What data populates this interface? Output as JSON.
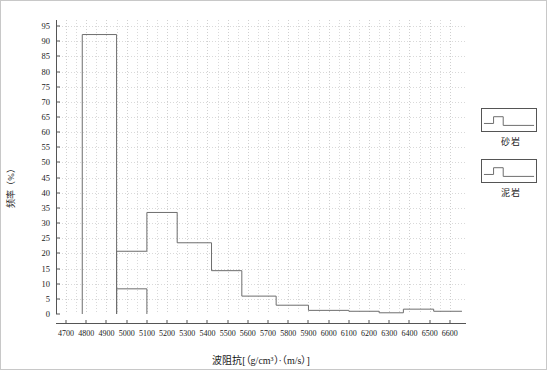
{
  "chart_data": {
    "type": "line",
    "title": "",
    "subtitle": "",
    "xlabel": "波阻抗[（g/cm³）·（m/s）]",
    "ylabel": "频率（%）",
    "xlim": [
      4650,
      6680
    ],
    "ylim": [
      0,
      97
    ],
    "grid": true,
    "legend_position": "right",
    "x_ticks": [
      4700,
      4800,
      4900,
      5000,
      5100,
      5200,
      5300,
      5400,
      5500,
      5600,
      5700,
      5800,
      5900,
      6000,
      6100,
      6200,
      6300,
      6400,
      6500,
      6600
    ],
    "y_ticks": [
      0,
      5,
      10,
      15,
      20,
      25,
      30,
      35,
      40,
      45,
      50,
      55,
      60,
      65,
      70,
      75,
      80,
      85,
      90,
      95
    ],
    "series": [
      {
        "name": "砂岩",
        "style": "step",
        "color": "#6e6e6e",
        "bin_edges": [
          4780,
          4950
        ],
        "values": [
          92.2
        ],
        "points": [
          [
            4780,
            0
          ],
          [
            4780,
            92.2
          ],
          [
            4950,
            92.2
          ],
          [
            4950,
            0
          ]
        ]
      },
      {
        "name": "泥岩",
        "style": "step",
        "color": "#6e6e6e",
        "bin_edges": [
          4950,
          5100,
          5250,
          5420,
          5570,
          5740,
          5900,
          6100,
          6250,
          6370,
          6520,
          6660
        ],
        "values": [
          20.7,
          33.5,
          23.5,
          14.3,
          5.9,
          2.9,
          1.2,
          0.9,
          0.4,
          1.6,
          0.9
        ],
        "points": [
          [
            4950,
            0
          ],
          [
            4950,
            20.7
          ],
          [
            5100,
            20.7
          ],
          [
            5100,
            33.5
          ],
          [
            5250,
            33.5
          ],
          [
            5250,
            23.5
          ],
          [
            5420,
            23.5
          ],
          [
            5420,
            14.3
          ],
          [
            5570,
            14.3
          ],
          [
            5570,
            5.9
          ],
          [
            5740,
            5.9
          ],
          [
            5740,
            2.9
          ],
          [
            5900,
            2.9
          ],
          [
            5900,
            1.2
          ],
          [
            6100,
            1.2
          ],
          [
            6100,
            0.9
          ],
          [
            6250,
            0.9
          ],
          [
            6250,
            0.4
          ],
          [
            6370,
            0.4
          ],
          [
            6370,
            1.6
          ],
          [
            6520,
            1.6
          ],
          [
            6520,
            0.9
          ],
          [
            6660,
            0.9
          ]
        ]
      },
      {
        "name": "泥岩-低段",
        "style": "step",
        "color": "#6e6e6e",
        "bin_edges": [
          4950,
          5100
        ],
        "values": [
          8.3
        ],
        "points": [
          [
            4950,
            0
          ],
          [
            4950,
            8.3
          ],
          [
            5100,
            8.3
          ],
          [
            5100,
            0
          ]
        ]
      }
    ]
  },
  "legend": {
    "entries": [
      {
        "label": "砂岩",
        "icon": "step-curve-icon"
      },
      {
        "label": "泥岩",
        "icon": "step-curve-icon"
      }
    ]
  },
  "axes": {
    "y_label": "频率（%）",
    "x_label": "波阻抗[（g/cm³）·（m/s）]"
  }
}
